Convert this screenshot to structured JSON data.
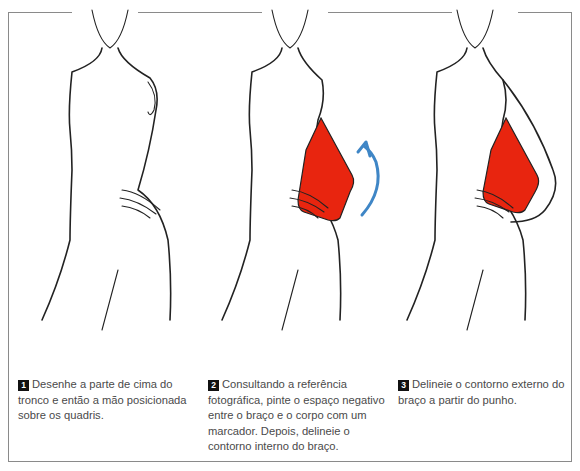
{
  "steps": [
    {
      "number": "1",
      "text": "Desenhe a parte de cima do tronco e então a mão posicionada sobre os quadris."
    },
    {
      "number": "2",
      "text": "Consultando a referência fotográfica, pinte o espaço negativo entre o braço e o corpo com um marcador. Depois, delineie o contorno interno do braço."
    },
    {
      "number": "3",
      "text": "Delineie o contorno externo do braço a partir do punho."
    }
  ],
  "colors": {
    "fill_marker": "#e8250f",
    "arrow": "#3f86c6",
    "line": "#222222",
    "frame": "#8a8a8a"
  },
  "icons": {
    "direction_arrow": "curved-up-arrow"
  }
}
